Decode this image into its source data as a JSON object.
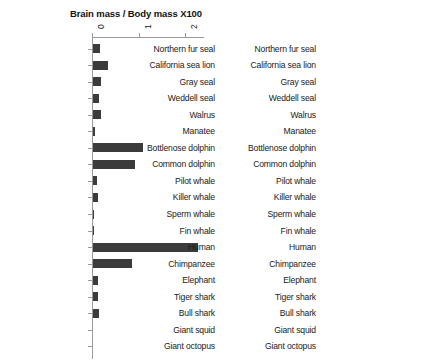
{
  "chart_data": [
    {
      "type": "bar",
      "orientation": "horizontal",
      "title": "Brain mass / Body mass X100",
      "xlabel": "",
      "ylabel": "",
      "xlim": [
        0,
        2.4
      ],
      "xticks": [
        0,
        1,
        2
      ],
      "xtick_labels": [
        "0",
        "1",
        "2"
      ],
      "grid": false,
      "legend": "none",
      "axis_position": "top",
      "bar_color": "#3b3b3b",
      "categories": [
        "Northern fur seal",
        "California sea lion",
        "Gray seal",
        "Weddell seal",
        "Walrus",
        "Manatee",
        "Bottlenose dolphin",
        "Common dolphin",
        "Pilot whale",
        "Killer whale",
        "Sperm whale",
        "Fin whale",
        "Human",
        "Chimpanzee",
        "Elephant",
        "Tiger shark",
        "Bull shark",
        "Giant squid",
        "Giant octopus"
      ],
      "values": [
        0.15,
        0.33,
        0.17,
        0.13,
        0.17,
        0.05,
        1.08,
        0.9,
        0.09,
        0.1,
        0.02,
        0.01,
        2.25,
        0.83,
        0.1,
        0.1,
        0.12,
        0,
        0
      ]
    },
    {
      "type": "bar",
      "orientation": "horizontal",
      "title": "Brain mass (kg)",
      "xlabel": "",
      "ylabel": "",
      "xlim": [
        0,
        10
      ],
      "xticks": [
        0,
        2,
        4,
        6,
        8,
        10
      ],
      "xtick_labels": [
        "0",
        "2",
        "4",
        "6",
        "8",
        "10"
      ],
      "grid": false,
      "legend": "none",
      "axis_position": "top",
      "bar_color": "#3b3b3b",
      "categories": [
        "Northern fur seal",
        "California sea lion",
        "Gray seal",
        "Weddell seal",
        "Walrus",
        "Manatee",
        "Bottlenose dolphin",
        "Common dolphin",
        "Pilot whale",
        "Killer whale",
        "Sperm whale",
        "Fin whale",
        "Human",
        "Chimpanzee",
        "Elephant",
        "Tiger shark",
        "Bull shark",
        "Giant squid",
        "Giant octopus"
      ],
      "values": [
        0.35,
        0.4,
        0.32,
        0.5,
        1.1,
        0.35,
        1.6,
        0.8,
        2.7,
        5.6,
        7.8,
        6.9,
        1.4,
        0.4,
        4.8,
        0.06,
        0.04,
        0,
        0
      ]
    }
  ]
}
